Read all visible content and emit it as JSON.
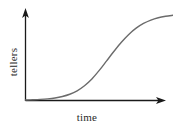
{
  "figure": {
    "background_color": "#ffffff",
    "width": 173,
    "height": 129
  },
  "chart_data": {
    "type": "line",
    "title": "",
    "subtitle": "",
    "xlabel": "time",
    "ylabel": "tellers",
    "grid": false,
    "legend": null,
    "annotations": [],
    "axis_style": {
      "arrowheads": true,
      "color": "#1a1a1a",
      "ticks": false,
      "tick_labels": false,
      "spines": [
        "left",
        "bottom"
      ]
    },
    "series": [
      {
        "name": "tellers",
        "color": "#6b6b6b",
        "line_width": 1.4,
        "shape": "sigmoid",
        "x": [
          0,
          5,
          10,
          15,
          20,
          25,
          30,
          35,
          40,
          45,
          50,
          55,
          60,
          65,
          70,
          75,
          80,
          85,
          90,
          95,
          100
        ],
        "y": [
          0,
          0.3,
          0.7,
          1.3,
          2.3,
          4.0,
          6.6,
          10.6,
          16.4,
          24.2,
          34.0,
          45.0,
          56.0,
          66.4,
          75.4,
          82.6,
          88.0,
          91.9,
          94.6,
          96.3,
          97.4
        ]
      }
    ],
    "xlim": [
      0,
      100
    ],
    "ylim": [
      0,
      100
    ]
  }
}
